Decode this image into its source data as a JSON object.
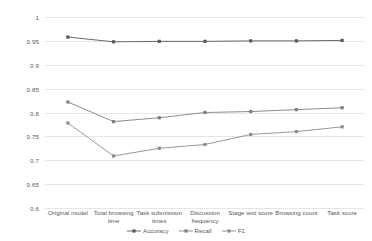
{
  "chart_data": {
    "type": "line",
    "title": "",
    "xlabel": "",
    "ylabel": "",
    "ylim": [
      0.6,
      1.0
    ],
    "ytick_step": 0.05,
    "yticks": [
      "1",
      "0.95",
      "0.9",
      "0.85",
      "0.8",
      "0.75",
      "0.7",
      "0.65",
      "0.6"
    ],
    "ytick_values": [
      1,
      0.95,
      0.9,
      0.85,
      0.8,
      0.75,
      0.7,
      0.65,
      0.6
    ],
    "grid": true,
    "legend_position": "bottom",
    "categories": [
      "Original model",
      "Total browsing time",
      "Task submission times",
      "Discussion frequency",
      "Stage test score",
      "Browsing count",
      "Task score"
    ],
    "series": [
      {
        "name": "Accuracy",
        "color": "#595959",
        "marker": "square",
        "values": [
          0.958,
          0.948,
          0.949,
          0.949,
          0.95,
          0.95,
          0.951
        ]
      },
      {
        "name": "Recall",
        "color": "#7f7f7f",
        "marker": "square",
        "values": [
          0.822,
          0.781,
          0.789,
          0.8,
          0.802,
          0.806,
          0.81
        ]
      },
      {
        "name": "F1",
        "color": "#8c8c8c",
        "marker": "square",
        "values": [
          0.778,
          0.709,
          0.725,
          0.733,
          0.754,
          0.76,
          0.77
        ]
      }
    ]
  }
}
